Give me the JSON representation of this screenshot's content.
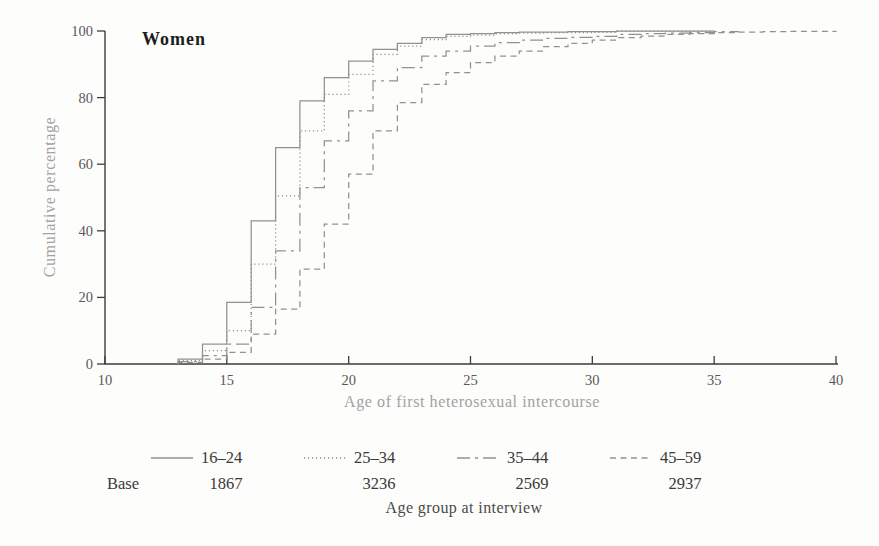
{
  "chart_data": {
    "type": "line",
    "variant": "cumulative-step",
    "title": "Women",
    "xlabel": "Age of first heterosexual intercourse",
    "ylabel": "Cumulative percentage",
    "xlim": [
      10,
      40
    ],
    "ylim": [
      0,
      100
    ],
    "x_ticks": [
      10,
      15,
      20,
      25,
      30,
      35,
      40
    ],
    "y_ticks": [
      0,
      20,
      40,
      60,
      80,
      100
    ],
    "grid": false,
    "legend_position": "bottom",
    "legend_title": "Age group at interview",
    "base_label": "Base",
    "line_color": "#919191",
    "axis_color": "#3d3d3d",
    "series": [
      {
        "label": "16–24",
        "base": 1867,
        "dash_name": "solid",
        "dash_array": "",
        "end_age": 35,
        "points": [
          [
            13,
            1.5
          ],
          [
            14,
            6
          ],
          [
            15,
            18.5
          ],
          [
            16,
            43
          ],
          [
            17,
            65
          ],
          [
            18,
            79
          ],
          [
            19,
            86
          ],
          [
            20,
            91
          ],
          [
            21,
            94.5
          ],
          [
            22,
            96.3
          ],
          [
            23,
            98
          ],
          [
            24,
            99
          ],
          [
            25,
            99.2
          ],
          [
            26,
            99.5
          ],
          [
            27,
            99.7
          ],
          [
            28,
            99.7
          ],
          [
            29,
            99.8
          ],
          [
            30,
            99.8
          ],
          [
            31,
            100
          ]
        ]
      },
      {
        "label": "25–34",
        "base": 3236,
        "dash_name": "dotted",
        "dash_array": "1.2 2.8",
        "end_age": 35,
        "points": [
          [
            13,
            1
          ],
          [
            14,
            4
          ],
          [
            15,
            10
          ],
          [
            16,
            30
          ],
          [
            17,
            50.5
          ],
          [
            18,
            70
          ],
          [
            19,
            81
          ],
          [
            20,
            87
          ],
          [
            21,
            93
          ],
          [
            22,
            95.5
          ],
          [
            23,
            97.4
          ],
          [
            24,
            98.4
          ],
          [
            25,
            98.8
          ],
          [
            26,
            99.2
          ],
          [
            27,
            99.4
          ],
          [
            28,
            99.5
          ],
          [
            29,
            99.5
          ],
          [
            30,
            99.6
          ],
          [
            31,
            100
          ]
        ]
      },
      {
        "label": "35–44",
        "base": 2569,
        "dash_name": "long-dash-short-dash",
        "dash_array": "13 5 3 5",
        "end_age": 36,
        "points": [
          [
            13,
            0.7
          ],
          [
            14,
            2.5
          ],
          [
            15,
            6
          ],
          [
            16,
            17
          ],
          [
            17,
            34
          ],
          [
            18,
            53
          ],
          [
            19,
            67
          ],
          [
            20,
            76
          ],
          [
            21,
            85
          ],
          [
            22,
            89
          ],
          [
            23,
            92.5
          ],
          [
            24,
            94
          ],
          [
            25,
            95.5
          ],
          [
            26,
            96.5
          ],
          [
            27,
            97.3
          ],
          [
            28,
            97.8
          ],
          [
            29,
            98.1
          ],
          [
            30,
            98.4
          ],
          [
            31,
            99
          ],
          [
            32,
            99.2
          ],
          [
            33,
            99.4
          ],
          [
            34,
            99.5
          ],
          [
            35,
            99.8
          ],
          [
            36,
            100
          ]
        ]
      },
      {
        "label": "45–59",
        "base": 2937,
        "dash_name": "dashed",
        "dash_array": "6 4.5",
        "end_age": 40,
        "points": [
          [
            13,
            0.5
          ],
          [
            14,
            1.5
          ],
          [
            15,
            3.5
          ],
          [
            16,
            9
          ],
          [
            17,
            16.5
          ],
          [
            18,
            28.5
          ],
          [
            19,
            42
          ],
          [
            20,
            57
          ],
          [
            21,
            70
          ],
          [
            22,
            78.5
          ],
          [
            23,
            84
          ],
          [
            24,
            87.5
          ],
          [
            25,
            90.5
          ],
          [
            26,
            92.5
          ],
          [
            27,
            94
          ],
          [
            28,
            95.3
          ],
          [
            29,
            96.3
          ],
          [
            30,
            97.3
          ],
          [
            31,
            98
          ],
          [
            32,
            98.5
          ],
          [
            33,
            99
          ],
          [
            34,
            99.2
          ],
          [
            35,
            99.5
          ],
          [
            36,
            99.7
          ],
          [
            37,
            99.8
          ],
          [
            38,
            99.9
          ],
          [
            39,
            99.9
          ],
          [
            40,
            100
          ]
        ]
      }
    ]
  }
}
